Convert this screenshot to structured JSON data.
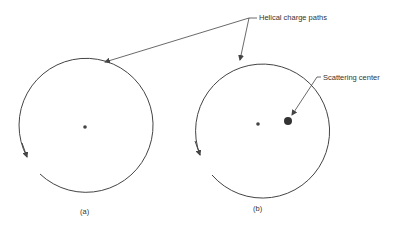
{
  "diagram": {
    "callouts": {
      "helical": "Helical charge paths",
      "scattering": "Scattering center"
    },
    "panels": [
      {
        "label": "(a)"
      },
      {
        "label": "(b)"
      }
    ],
    "colors": {
      "stroke": "#444444",
      "text": "#333333",
      "background": "#ffffff"
    }
  }
}
